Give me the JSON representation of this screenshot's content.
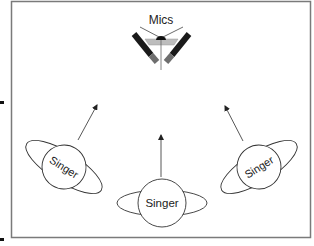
{
  "diagram": {
    "mics_label": "Mics",
    "singers": [
      {
        "label": "Singer",
        "position": "left"
      },
      {
        "label": "Singer",
        "position": "center"
      },
      {
        "label": "Singer",
        "position": "right"
      }
    ],
    "colors": {
      "frame": "#7a7a7a",
      "mic_body": "#1a1a1a",
      "mic_tip": "#6e6e6e",
      "mic_bar": "#bdbdbd",
      "stroke": "#333333"
    }
  }
}
